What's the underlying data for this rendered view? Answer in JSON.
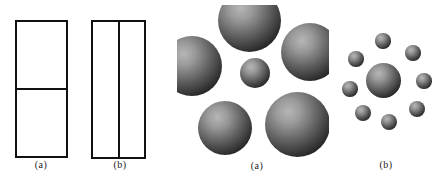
{
  "canvas": {
    "width": 445,
    "height": 184,
    "background": "#ffffff"
  },
  "palette": {
    "ink": "#111111",
    "sphere_highlight": "#b6b6b6",
    "sphere_light": "#9a9a9a",
    "sphere_mid": "#676767",
    "sphere_shade": "#2b2b2b",
    "sphere_dark": "#0d0d0d"
  },
  "rect_diagram": {
    "rects": [
      {
        "label": "(a)",
        "x": 15,
        "y": 20,
        "w": 53,
        "h": 138,
        "divider": "horizontal"
      },
      {
        "label": "(b)",
        "x": 91,
        "y": 20,
        "w": 55,
        "h": 139,
        "divider": "vertical"
      }
    ]
  },
  "sphere_diagram": {
    "packed": {
      "label": "(a)",
      "region": {
        "x": 177,
        "y": 5,
        "w": 152,
        "h": 152
      },
      "spheres": [
        {
          "cx": 72,
          "cy": 15,
          "r": 31.5
        },
        {
          "cx": 15,
          "cy": 61,
          "r": 30
        },
        {
          "cx": 133,
          "cy": 47,
          "r": 29
        },
        {
          "cx": 78,
          "cy": 68,
          "r": 15
        },
        {
          "cx": 48,
          "cy": 123,
          "r": 27
        },
        {
          "cx": 120,
          "cy": 119,
          "r": 32.5
        }
      ]
    },
    "dispersed": {
      "label": "(b)",
      "spheres": [
        {
          "cx": 383,
          "cy": 80,
          "r": 17.5
        },
        {
          "cx": 383,
          "cy": 41,
          "r": 7.7
        },
        {
          "cx": 413,
          "cy": 53,
          "r": 7.7
        },
        {
          "cx": 424,
          "cy": 81,
          "r": 7.7
        },
        {
          "cx": 417,
          "cy": 109,
          "r": 8
        },
        {
          "cx": 389,
          "cy": 122,
          "r": 8
        },
        {
          "cx": 363,
          "cy": 113,
          "r": 8
        },
        {
          "cx": 350,
          "cy": 89,
          "r": 7.7
        },
        {
          "cx": 356,
          "cy": 59,
          "r": 7.7
        }
      ]
    }
  }
}
